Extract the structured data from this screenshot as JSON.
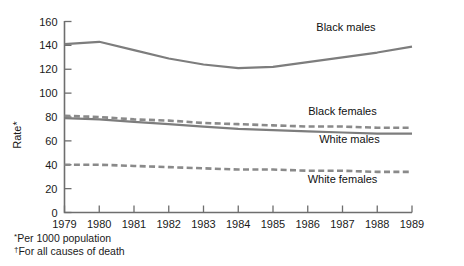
{
  "chart_data": {
    "type": "line",
    "title": "",
    "xlabel": "",
    "ylabel": "Rate*",
    "x": [
      1979,
      1980,
      1981,
      1982,
      1983,
      1984,
      1985,
      1986,
      1987,
      1988,
      1989
    ],
    "xtick_labels": [
      "1979",
      "1980",
      "1981",
      "1982",
      "1983",
      "1984",
      "1985",
      "1986",
      "1987",
      "1988",
      "1989"
    ],
    "ytick_labels": [
      "0",
      "20",
      "40",
      "60",
      "80",
      "100",
      "120",
      "140",
      "160"
    ],
    "yticks": [
      0,
      20,
      40,
      60,
      80,
      100,
      120,
      140,
      160
    ],
    "ylim": [
      0,
      160
    ],
    "xlim": [
      1979,
      1989
    ],
    "grid": false,
    "legend_position": "inline-right",
    "series": [
      {
        "name": "Black males",
        "style": "solid",
        "color": "#7d7d7d",
        "values": [
          141,
          143,
          136,
          129,
          124,
          121,
          122,
          126,
          130,
          134,
          139
        ]
      },
      {
        "name": "Black females",
        "style": "dashed",
        "color": "#8a8a8a",
        "values": [
          81,
          80,
          78,
          77,
          75,
          74,
          73,
          72,
          72,
          71,
          71
        ]
      },
      {
        "name": "White males",
        "style": "solid",
        "color": "#7d7d7d",
        "values": [
          79,
          78,
          76,
          74,
          72,
          70,
          69,
          68,
          67,
          66,
          66
        ]
      },
      {
        "name": "White females",
        "style": "dashed",
        "color": "#8a8a8a",
        "values": [
          40,
          40,
          39,
          38,
          37,
          36,
          36,
          35,
          35,
          34,
          34
        ]
      }
    ],
    "annotations": [
      {
        "text": "Black males",
        "x": 1987.1,
        "y": 152
      },
      {
        "text": "Black females",
        "x": 1987.0,
        "y": 82
      },
      {
        "text": "White males",
        "x": 1987.2,
        "y": 58
      },
      {
        "text": "White females",
        "x": 1987.0,
        "y": 25
      }
    ],
    "footnotes": [
      {
        "mark": "*",
        "text": "Per 1000 population"
      },
      {
        "mark": "†",
        "text": "For all causes of death"
      }
    ]
  },
  "axis": {
    "y_title": "Rate*"
  }
}
